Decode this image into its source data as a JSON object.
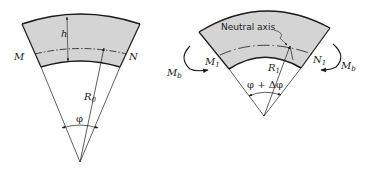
{
  "figure": {
    "colors": {
      "fill": "#d4d4d4",
      "stroke": "#1a1a1a",
      "background": "#ffffff"
    },
    "left": {
      "label_h": "h",
      "label_M": "M",
      "label_N": "N",
      "label_R": "R",
      "label_R_sub": "0",
      "label_angle": "φ"
    },
    "right": {
      "label_neutral_axis": "Neutral axis",
      "label_M": "M",
      "label_M_sub": "1",
      "label_N": "N",
      "label_N_sub": "1",
      "label_R": "R",
      "label_R_sub": "1",
      "label_angle": "φ + Δφ",
      "moment_left": "M",
      "moment_left_sub": "b",
      "moment_right": "M",
      "moment_right_sub": "b"
    }
  }
}
